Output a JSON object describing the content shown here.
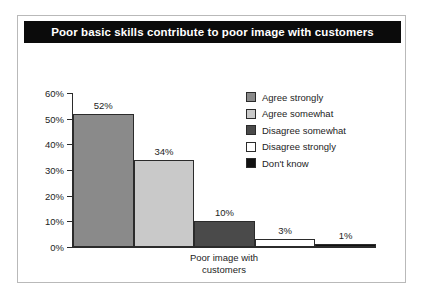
{
  "panel": {
    "title": "Poor basic skills contribute to poor image with customers"
  },
  "colors": {
    "title_bar_bg": "#0b0b0b",
    "title_text": "#ffffff",
    "axis": "#2b2b2b",
    "text": "#1d1d1d",
    "panel_border": "#b9b9b9",
    "series": [
      "#8a8a8a",
      "#c9c9c9",
      "#4a4a4a",
      "#ffffff",
      "#111111"
    ]
  },
  "legend": {
    "position": "right",
    "items": [
      {
        "label": "Agree strongly",
        "color": "#8a8a8a"
      },
      {
        "label": "Agree somewhat",
        "color": "#c9c9c9"
      },
      {
        "label": "Disagree somewhat",
        "color": "#4a4a4a"
      },
      {
        "label": "Disagree strongly",
        "color": "#ffffff"
      },
      {
        "label": "Don't know",
        "color": "#111111"
      }
    ]
  },
  "yaxis": {
    "ticks": [
      "60%",
      "50%",
      "40%",
      "30%",
      "20%",
      "10%",
      "0%"
    ]
  },
  "xaxis": {
    "category_lines": [
      "Poor image with",
      "customers"
    ]
  },
  "chart_data": {
    "type": "bar",
    "title": "Poor basic skills contribute to poor image with customers",
    "xlabel": "Poor image with customers",
    "ylabel": "",
    "categories": [
      "Agree strongly",
      "Agree somewhat",
      "Disagree somewhat",
      "Disagree strongly",
      "Don't know"
    ],
    "values": [
      52,
      34,
      10,
      3,
      1
    ],
    "value_labels": [
      "52%",
      "34%",
      "10%",
      "3%",
      "1%"
    ],
    "ylim": [
      0,
      60
    ],
    "ytick_values": [
      0,
      10,
      20,
      30,
      40,
      50,
      60
    ],
    "ytick_labels": [
      "0%",
      "10%",
      "20%",
      "30%",
      "40%",
      "50%",
      "60%"
    ],
    "grid": false,
    "legend_position": "right",
    "colors": [
      "#8a8a8a",
      "#c9c9c9",
      "#4a4a4a",
      "#ffffff",
      "#111111"
    ]
  }
}
